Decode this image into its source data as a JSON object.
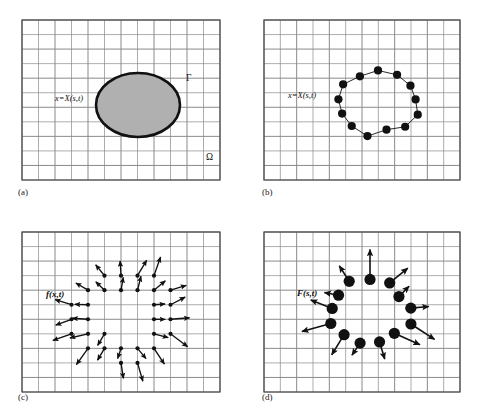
{
  "figure": {
    "background_color": "#ffffff",
    "grid_line_color": "#8a8a8a",
    "grid_major_color": "#6e6e6e",
    "border_color": "#4a4a4a",
    "ink_color": "#111111",
    "ellipse_fill": "#b0b0b0",
    "ellipse_stroke": "#111111"
  },
  "panels": [
    {
      "id": "a",
      "caption": "(a)",
      "caption_pos": [
        18,
        195
      ],
      "grid": {
        "x": 22,
        "y": 20,
        "w": 198,
        "h": 160,
        "cols": 12,
        "rows": 11
      },
      "labels": [
        {
          "name": "position-label",
          "text": "x=X(s,t)",
          "x": 55,
          "y": 101,
          "style": "italic"
        },
        {
          "name": "gamma-label",
          "text": "Γ",
          "x": 186,
          "y": 81,
          "style": "greek"
        },
        {
          "name": "omega-label",
          "text": "Ω",
          "x": 206,
          "y": 160,
          "style": "greek"
        }
      ],
      "ellipse": {
        "cx": 138,
        "cy": 105,
        "rx": 42,
        "ry": 32
      }
    },
    {
      "id": "b",
      "caption": "(b)",
      "caption_pos": [
        262,
        195
      ],
      "grid": {
        "x": 264,
        "y": 20,
        "w": 196,
        "h": 160,
        "cols": 12,
        "rows": 11
      },
      "labels": [
        {
          "name": "position-label",
          "text": "x=X(s,t)",
          "x": 288,
          "y": 98,
          "style": "italic"
        }
      ],
      "marker_curve": {
        "cx": 378,
        "cy": 103,
        "rx": 40,
        "ry": 31,
        "marker_count": 13,
        "marker_radius": 4.1
      }
    },
    {
      "id": "c",
      "caption": "(c)",
      "caption_pos": [
        18,
        400
      ],
      "grid": {
        "x": 22,
        "y": 232,
        "w": 198,
        "h": 160,
        "cols": 12,
        "rows": 11
      },
      "labels": [
        {
          "name": "eulerian-force-label",
          "text": "f(x,t)",
          "x": 46,
          "y": 297,
          "style": "bold-italic"
        }
      ],
      "field": {
        "cx": 124,
        "cy": 316,
        "node_radius": 2.1,
        "arrow_count": 44
      }
    },
    {
      "id": "d",
      "caption": "(d)",
      "caption_pos": [
        262,
        400
      ],
      "grid": {
        "x": 264,
        "y": 232,
        "w": 196,
        "h": 160,
        "cols": 12,
        "rows": 11
      },
      "labels": [
        {
          "name": "lagrangian-force-label",
          "text": "F(s,t)",
          "x": 297,
          "y": 296,
          "style": "bold-italic"
        }
      ],
      "markers": {
        "cx": 370,
        "cy": 312,
        "rx": 40,
        "ry": 31,
        "marker_count": 13,
        "marker_radius": 5.6
      }
    }
  ],
  "chart_data": {
    "type": "diagram",
    "panel_a": {
      "description": "Continuous immersed elastic body (filled ellipse) with boundary Gamma inside fluid domain Omega on a Cartesian grid",
      "boundary_symbol": "Γ",
      "domain_symbol": "Ω",
      "parametrization": "x=X(s,t)"
    },
    "panel_b": {
      "description": "Discretized Lagrangian boundary markers along the interface curve",
      "marker_count": 13,
      "parametrization": "x=X(s,t)"
    },
    "panel_c": {
      "description": "Eulerian force density f(x,t) spread to Cartesian grid nodes near the interface",
      "symbol": "f(x,t)",
      "node_count": 44
    },
    "panel_d": {
      "description": "Lagrangian force F(s,t) carried by the boundary markers",
      "symbol": "F(s,t)",
      "marker_count": 13
    }
  }
}
